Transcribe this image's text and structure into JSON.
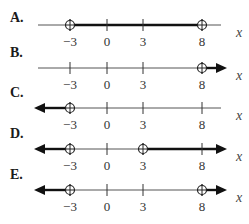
{
  "problem": {
    "axis_variable": "x",
    "ticks": [
      -3,
      0,
      3,
      8
    ],
    "tick_labels": [
      "−3",
      "0",
      "3",
      "8"
    ],
    "options": [
      {
        "label": "A.",
        "open_points": [
          -3,
          8
        ],
        "segments": [
          [
            -3,
            8
          ]
        ],
        "arrow_left": false,
        "arrow_right": false
      },
      {
        "label": "B.",
        "open_points": [
          8
        ],
        "segments": [
          [
            8,
            "inf"
          ]
        ],
        "arrow_left": false,
        "arrow_right": true
      },
      {
        "label": "C.",
        "open_points": [
          -3
        ],
        "segments": [
          [
            "-inf",
            -3
          ]
        ],
        "arrow_left": true,
        "arrow_right": false
      },
      {
        "label": "D.",
        "open_points": [
          -3,
          3
        ],
        "segments": [
          [
            "-inf",
            -3
          ],
          [
            3,
            "inf"
          ]
        ],
        "arrow_left": true,
        "arrow_right": true
      },
      {
        "label": "E.",
        "open_points": [
          -3,
          8
        ],
        "segments": [
          [
            "-inf",
            -3
          ],
          [
            8,
            "inf"
          ]
        ],
        "arrow_left": true,
        "arrow_right": true
      }
    ]
  }
}
